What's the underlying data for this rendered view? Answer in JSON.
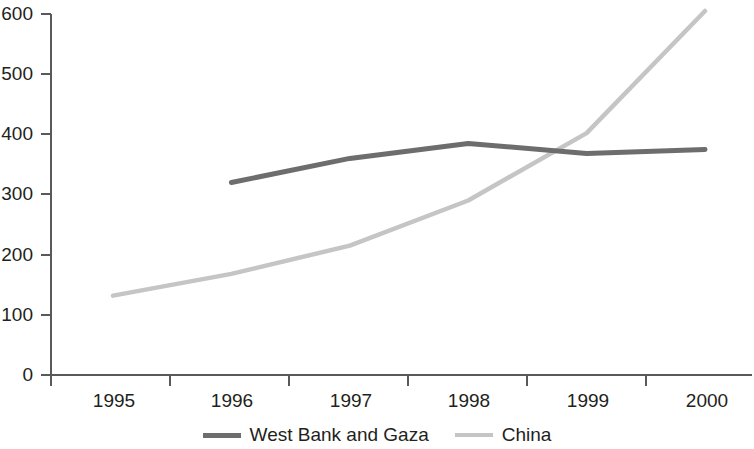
{
  "chart_data": {
    "type": "line",
    "title": "",
    "subtitle": "",
    "xlabel": "",
    "ylabel": "",
    "x": [
      1995,
      1996,
      1997,
      1998,
      1999,
      2000
    ],
    "categories": [
      "1995",
      "1996",
      "1997",
      "1998",
      "1999",
      "2000"
    ],
    "xlim": [
      1995,
      2000
    ],
    "ylim": [
      0,
      600
    ],
    "ytick_values": [
      0,
      100,
      200,
      300,
      400,
      500,
      600
    ],
    "ytick_labels": [
      "0",
      "100",
      "200",
      "300",
      "400",
      "500",
      "600"
    ],
    "xtick_labels": [
      "1995",
      "1996",
      "1997",
      "1998",
      "1999",
      "2000"
    ],
    "grid": false,
    "legend_position": "bottom-center",
    "series": [
      {
        "name": "West Bank and Gaza",
        "color": "#6d6d6d",
        "x": [
          1996,
          1997,
          1998,
          1999,
          2000
        ],
        "values": [
          320,
          360,
          385,
          368,
          375
        ]
      },
      {
        "name": "China",
        "color": "#c5c5c5",
        "x": [
          1995,
          1996,
          1997,
          1998,
          1999,
          2000
        ],
        "values": [
          132,
          168,
          215,
          290,
          402,
          605
        ]
      }
    ]
  },
  "legend": {
    "items": [
      {
        "label": "West Bank and Gaza",
        "color": "#6d6d6d"
      },
      {
        "label": "China",
        "color": "#c5c5c5"
      }
    ]
  },
  "axes": {
    "axis_color": "#58595b",
    "y_ticks": [
      {
        "label": "600"
      },
      {
        "label": "500"
      },
      {
        "label": "400"
      },
      {
        "label": "300"
      },
      {
        "label": "200"
      },
      {
        "label": "100"
      },
      {
        "label": "0"
      }
    ],
    "x_ticks": [
      {
        "label": "1995"
      },
      {
        "label": "1996"
      },
      {
        "label": "1997"
      },
      {
        "label": "1998"
      },
      {
        "label": "1999"
      },
      {
        "label": "2000"
      }
    ]
  }
}
